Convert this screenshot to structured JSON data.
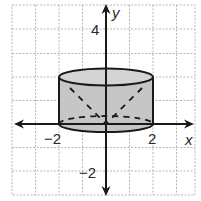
{
  "figure": {
    "axes": {
      "x_label": "x",
      "y_label": "y",
      "x_ticks": [
        {
          "value": -2,
          "label": "−2"
        },
        {
          "value": 2,
          "label": "2"
        }
      ],
      "y_ticks": [
        {
          "value": 4,
          "label": "4"
        },
        {
          "value": -2,
          "label": "−2"
        }
      ],
      "x_range": [
        -4,
        3
      ],
      "y_range": [
        -3,
        5
      ]
    },
    "grid": {
      "style": "dashed",
      "color": "#9a9a9a",
      "spacing_units": 1
    },
    "shape": {
      "type": "cylinder",
      "radius": 2,
      "bottom_y": 0,
      "top_y": 2,
      "fill": "#c8c8c8",
      "stroke": "#1a1a1a",
      "hidden_edges": "dashed"
    },
    "colors": {
      "axis": "#1a1a1a",
      "grid": "#a0a0a0",
      "fill": "#c6c6c6",
      "background": "#ffffff"
    }
  }
}
